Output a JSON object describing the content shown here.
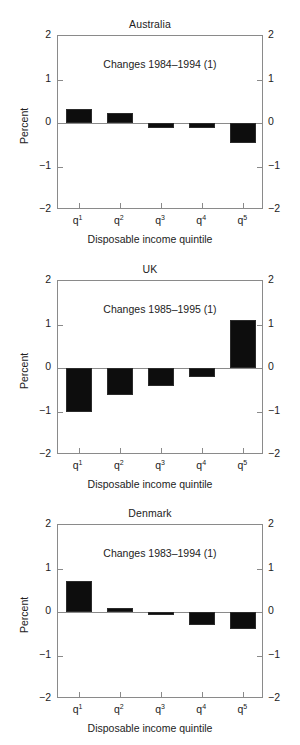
{
  "figure": {
    "x_axis_title": "Disposable income quintile",
    "y_axis_title": "Percent",
    "y_ticks": [
      "2",
      "1",
      "0",
      "-1",
      "-2"
    ],
    "x_tick_bases": [
      "q",
      "q",
      "q",
      "q",
      "q"
    ],
    "x_tick_sups": [
      "1",
      "2",
      "3",
      "4",
      "5"
    ],
    "bar_color": "#0d0d0d",
    "axis_color": "#8a8a8a"
  },
  "chart_data": [
    {
      "type": "bar",
      "title": "Australia",
      "annotation": "Changes 1984–1994 (1)",
      "categories": [
        "q1",
        "q2",
        "q3",
        "q4",
        "q5"
      ],
      "values": [
        0.32,
        0.22,
        -0.11,
        -0.11,
        -0.46
      ],
      "xlabel": "Disposable income quintile",
      "ylabel": "Percent",
      "ylim": [
        -2,
        2
      ],
      "yticks": [
        -2,
        -1,
        0,
        1,
        2
      ],
      "grid": false,
      "legend": "none"
    },
    {
      "type": "bar",
      "title": "UK",
      "annotation": "Changes 1985–1995 (1)",
      "categories": [
        "q1",
        "q2",
        "q3",
        "q4",
        "q5"
      ],
      "values": [
        -1.0,
        -0.62,
        -0.42,
        -0.2,
        1.1
      ],
      "xlabel": "Disposable income quintile",
      "ylabel": "Percent",
      "ylim": [
        -2,
        2
      ],
      "yticks": [
        -2,
        -1,
        0,
        1,
        2
      ],
      "grid": false,
      "legend": "none"
    },
    {
      "type": "bar",
      "title": "Denmark",
      "annotation": "Changes 1983–1994 (1)",
      "categories": [
        "q1",
        "q2",
        "q3",
        "q4",
        "q5"
      ],
      "values": [
        0.72,
        0.09,
        -0.08,
        -0.3,
        -0.4
      ],
      "xlabel": "Disposable income quintile",
      "ylabel": "Percent",
      "ylim": [
        -2,
        2
      ],
      "yticks": [
        -2,
        -1,
        0,
        1,
        2
      ],
      "grid": false,
      "legend": "none"
    }
  ]
}
